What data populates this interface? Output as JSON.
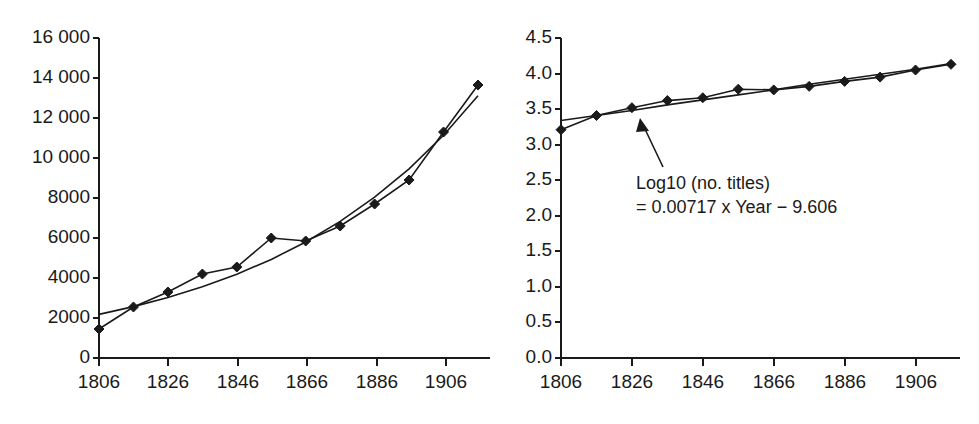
{
  "figure": {
    "background_color": "#ffffff",
    "ink_color": "#1a1a1a",
    "panel_count": 2
  },
  "chart_data": [
    {
      "panel": "left",
      "type": "line",
      "title": "",
      "subtitle": "",
      "xlabel": "",
      "ylabel": "",
      "xlim": [
        1806,
        1916
      ],
      "ylim": [
        0,
        16000
      ],
      "grid": false,
      "legend": null,
      "x_tick_labels": [
        "1806",
        "1826",
        "1846",
        "1866",
        "1886",
        "1906"
      ],
      "x_tick_values": [
        1806,
        1826,
        1846,
        1866,
        1886,
        1906
      ],
      "x_minor_tick_values": [
        1816,
        1836,
        1856,
        1876,
        1896,
        1916
      ],
      "y_tick_labels": [
        "0",
        "2000",
        "4000",
        "6000",
        "8000",
        "10 000",
        "12 000",
        "14 000",
        "16 000"
      ],
      "y_tick_values": [
        0,
        2000,
        4000,
        6000,
        8000,
        10000,
        12000,
        14000,
        16000
      ],
      "x": [
        1806,
        1816,
        1826,
        1836,
        1846,
        1856,
        1866,
        1876,
        1886,
        1896,
        1906,
        1916
      ],
      "series": [
        {
          "name": "no. titles",
          "marker": "diamond",
          "values": [
            1450,
            2550,
            3300,
            4200,
            4550,
            6000,
            5850,
            6600,
            7700,
            8900,
            11300,
            13650
          ]
        },
        {
          "name": "exponential fit",
          "marker": "none",
          "values": [
            2180,
            2570,
            3020,
            3560,
            4190,
            4930,
            5800,
            6830,
            8040,
            9460,
            11140,
            13110
          ]
        }
      ],
      "annotations": []
    },
    {
      "panel": "right",
      "type": "line",
      "title": "",
      "subtitle": "",
      "xlabel": "",
      "ylabel": "",
      "xlim": [
        1806,
        1916
      ],
      "ylim": [
        0.0,
        4.5
      ],
      "grid": false,
      "legend": null,
      "x_tick_labels": [
        "1806",
        "1826",
        "1846",
        "1866",
        "1886",
        "1906"
      ],
      "x_tick_values": [
        1806,
        1826,
        1846,
        1866,
        1886,
        1906
      ],
      "x_minor_tick_values": [
        1816,
        1836,
        1856,
        1876,
        1896,
        1916
      ],
      "y_tick_labels": [
        "0.0",
        "0.5",
        "1.0",
        "1.5",
        "2.0",
        "2.5",
        "3.0",
        "3.5",
        "4.0",
        "4.5"
      ],
      "y_tick_values": [
        0.0,
        0.5,
        1.0,
        1.5,
        2.0,
        2.5,
        3.0,
        3.5,
        4.0,
        4.5
      ],
      "x": [
        1806,
        1816,
        1826,
        1836,
        1846,
        1856,
        1866,
        1876,
        1886,
        1896,
        1906,
        1916
      ],
      "series": [
        {
          "name": "Log10 (no. titles)",
          "marker": "diamond",
          "values": [
            3.21,
            3.41,
            3.52,
            3.62,
            3.66,
            3.78,
            3.77,
            3.82,
            3.89,
            3.95,
            4.05,
            4.13
          ]
        },
        {
          "name": "linear fit",
          "marker": "none",
          "values": [
            3.34,
            3.41,
            3.48,
            3.56,
            3.63,
            3.7,
            3.77,
            3.85,
            3.92,
            3.99,
            4.06,
            4.14
          ]
        }
      ],
      "annotations": [
        {
          "name": "fit-equation",
          "line1": "Log10 (no. titles)",
          "line2": "= 0.00717 x Year − 9.606",
          "arrow": "points up-left to fitted line"
        }
      ]
    }
  ]
}
